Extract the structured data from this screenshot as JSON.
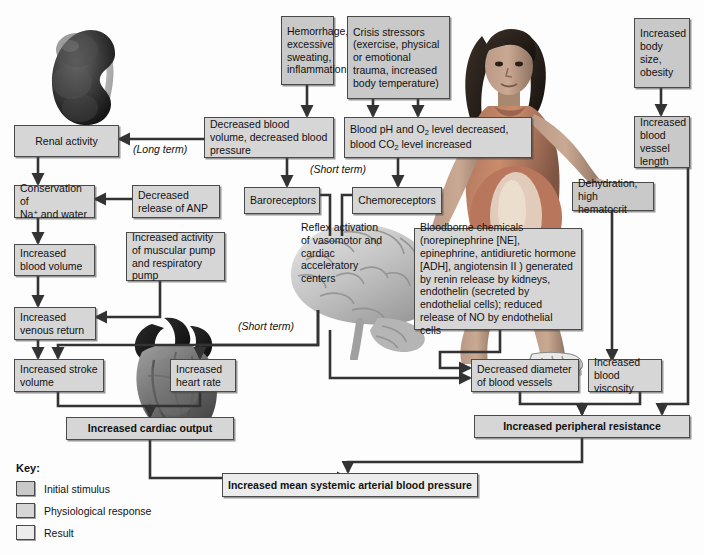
{
  "diagram": {
    "colors": {
      "initial_stimulus": "#c9c9c9",
      "physiological_response": "#d6d6d6",
      "result": "#ececec",
      "connector": "#333333",
      "box_border": "#4a4a4a"
    }
  },
  "boxes": {
    "hemorrhage": "Hemorrhage, excessive sweating, inflammation",
    "crisis_stressors": "Crisis stressors (exercise, physical or emotional trauma, increased body temperature)",
    "increased_body_size": "Increased body size, obesity",
    "decreased_blood_volume": "Decreased blood volume, decreased blood pressure",
    "blood_ph_line1_a": "Blood pH and O",
    "blood_ph_line1_b": "2",
    "blood_ph_line1_c": " level decreased,",
    "blood_ph_line2_a": "blood CO",
    "blood_ph_line2_b": "2",
    "blood_ph_line2_c": " level increased",
    "increased_vessel_length": "Increased blood vessel length",
    "renal_activity": "Renal activity",
    "baroreceptors": "Baroreceptors",
    "chemoreceptors": "Chemoreceptors",
    "dehydration": "Dehydration, high hematocrit",
    "conservation_line1": "Conservation of",
    "conservation_line2_a": "Na",
    "conservation_line2_b": "+",
    "conservation_line2_c": " and water",
    "decreased_anp": "Decreased release of ANP",
    "reflex_activation": "Reflex activation of vasomotor and cardiac acceleratory centers",
    "bloodborne_chemicals": "Bloodborne chemicals (norepinephrine [NE], epinephrine, antidiuretic hormone [ADH], angiotensin II ) generated by renin release by kidneys, endothelin (secreted by endothelial cells); reduced release of NO by endothelial cells",
    "increased_blood_volume": "Increased blood volume",
    "increased_muscular_pump": "Increased activity of muscular pump and respiratory pump",
    "increased_venous_return": "Increased venous return",
    "increased_stroke_volume": "Increased stroke volume",
    "increased_heart_rate": "Increased heart rate",
    "decreased_diameter": "Decreased diameter of blood vessels",
    "increased_viscosity": "Increased blood viscosity",
    "increased_cardiac_output": "Increased cardiac output",
    "increased_peripheral_resistance": "Increased peripheral resistance",
    "increased_map": "Increased mean systemic arterial blood pressure"
  },
  "terms": {
    "long_term": "(Long term)",
    "short_term_upper": "(Short term)",
    "short_term_lower": "(Short term)"
  },
  "legend": {
    "title": "Key:",
    "items": [
      {
        "label": "Initial stimulus",
        "swatch": "#c9c9c9"
      },
      {
        "label": "Physiological response",
        "swatch": "#d6d6d6"
      },
      {
        "label": "Result",
        "swatch": "#ececec"
      }
    ]
  },
  "artwork": {
    "kidney": "kidney-illustration",
    "woman": "pregnant-woman-illustration",
    "brain": "brain-illustration",
    "heart": "heart-illustration"
  }
}
